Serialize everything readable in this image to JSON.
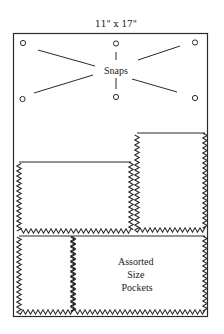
{
  "diagram": {
    "title": "11\" x 17\"",
    "board_label": "Bulletin board",
    "snaps": {
      "label": "Snaps",
      "count": 6,
      "items": [
        {
          "name": "top-left"
        },
        {
          "name": "top-center"
        },
        {
          "name": "top-right"
        },
        {
          "name": "bottom-left"
        },
        {
          "name": "bottom-center"
        },
        {
          "name": "bottom-right"
        }
      ]
    },
    "pockets": {
      "label_lines": [
        "Assorted",
        "Size",
        "Pockets"
      ],
      "items": [
        {
          "name": "middle-left-pocket",
          "edge": "pinked"
        },
        {
          "name": "middle-right-pocket",
          "edge": "pinked"
        },
        {
          "name": "bottom-left-pocket",
          "edge": "pinked"
        },
        {
          "name": "bottom-right-pocket",
          "edge": "pinked"
        }
      ]
    },
    "colors": {
      "line": "#2a2a2a",
      "background": "#ffffff"
    }
  }
}
